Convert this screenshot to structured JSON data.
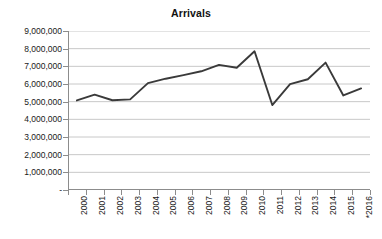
{
  "chart_data": {
    "type": "line",
    "title": "Arrivals",
    "xlabel": "",
    "ylabel": "",
    "categories": [
      "2000",
      "2001",
      "2002",
      "2003",
      "2004",
      "2005",
      "2006",
      "2007",
      "2008",
      "2009",
      "2010",
      "2011",
      "2012",
      "2013",
      "2014",
      "2015",
      "*2016"
    ],
    "values": [
      5070000,
      5400000,
      5080000,
      5130000,
      6050000,
      6300000,
      6500000,
      6720000,
      7080000,
      6920000,
      7850000,
      4810000,
      5990000,
      6270000,
      7210000,
      5350000,
      5750000
    ],
    "series": [
      {
        "name": "Arrivals",
        "values": [
          5070000,
          5400000,
          5080000,
          5130000,
          6050000,
          6300000,
          6500000,
          6720000,
          7080000,
          6920000,
          7850000,
          4810000,
          5990000,
          6270000,
          7210000,
          5350000,
          5750000
        ]
      }
    ],
    "ytick_labels": [
      "9,000,000",
      "8,000,000",
      "7,000,000",
      "6,000,000",
      "5,000,000",
      "4,000,000",
      "3,000,000",
      "2,000,000",
      "1,000,000",
      "-"
    ],
    "ytick_values": [
      9000000,
      8000000,
      7000000,
      6000000,
      5000000,
      4000000,
      3000000,
      2000000,
      1000000,
      0
    ],
    "ylim": [
      0,
      9000000
    ],
    "grid": "horizontal",
    "legend": "none",
    "line_color": "#3a3a3a",
    "grid_color": "#c8c8c8",
    "axis_color": "#8c8c8c",
    "annotation": "* denotes provisional figure for 2016"
  }
}
